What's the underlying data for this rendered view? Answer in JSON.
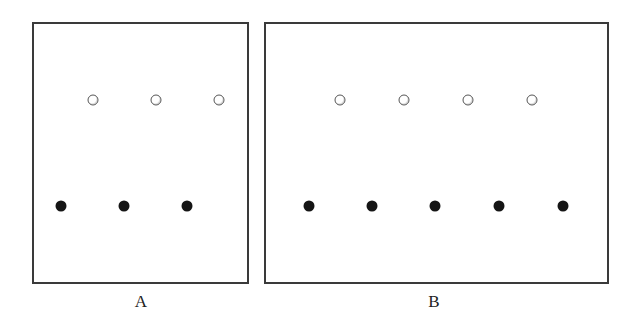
{
  "panels": [
    {
      "id": "A",
      "label": "A",
      "box": {
        "x": 32,
        "y": 22,
        "w": 217,
        "h": 262
      },
      "label_pos": {
        "x": 141,
        "y": 292
      },
      "open_dots": [
        {
          "x": 93,
          "y": 100
        },
        {
          "x": 156,
          "y": 100
        },
        {
          "x": 219,
          "y": 100
        }
      ],
      "filled_dots": [
        {
          "x": 61,
          "y": 206
        },
        {
          "x": 124,
          "y": 206
        },
        {
          "x": 187,
          "y": 206
        }
      ]
    },
    {
      "id": "B",
      "label": "B",
      "box": {
        "x": 264,
        "y": 22,
        "w": 345,
        "h": 262
      },
      "label_pos": {
        "x": 434,
        "y": 292
      },
      "open_dots": [
        {
          "x": 340,
          "y": 100
        },
        {
          "x": 404,
          "y": 100
        },
        {
          "x": 468,
          "y": 100
        },
        {
          "x": 532,
          "y": 100
        }
      ],
      "filled_dots": [
        {
          "x": 309,
          "y": 206
        },
        {
          "x": 372,
          "y": 206
        },
        {
          "x": 435,
          "y": 206
        },
        {
          "x": 499,
          "y": 206
        },
        {
          "x": 563,
          "y": 206
        }
      ]
    }
  ],
  "summary": {
    "A": {
      "open_count": 3,
      "filled_count": 3
    },
    "B": {
      "open_count": 4,
      "filled_count": 5
    }
  },
  "colors": {
    "border": "#3a3a3a",
    "filled_dot": "#151515",
    "open_dot_stroke": "#555555"
  }
}
